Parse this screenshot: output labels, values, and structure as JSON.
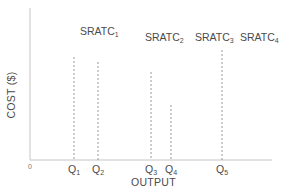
{
  "chart_data": {
    "type": "diagram",
    "title": "",
    "xlabel": "OUTPUT",
    "ylabel": "COST ($)",
    "origin_label": "0",
    "curves": [
      {
        "name": "SRATC",
        "sub": "1"
      },
      {
        "name": "SRATC",
        "sub": "2"
      },
      {
        "name": "SRATC",
        "sub": "3"
      },
      {
        "name": "SRATC",
        "sub": "4"
      }
    ],
    "quantities": [
      {
        "name": "Q",
        "sub": "1",
        "x": 74,
        "top": 57
      },
      {
        "name": "Q",
        "sub": "2",
        "x": 98,
        "top": 62
      },
      {
        "name": "Q",
        "sub": "3",
        "x": 151,
        "top": 72
      },
      {
        "name": "Q",
        "sub": "4",
        "x": 171,
        "top": 105
      },
      {
        "name": "Q",
        "sub": "5",
        "x": 222,
        "top": 50
      }
    ],
    "axis_color": "#bdbdbd",
    "dash_color": "#9a9a9a"
  }
}
